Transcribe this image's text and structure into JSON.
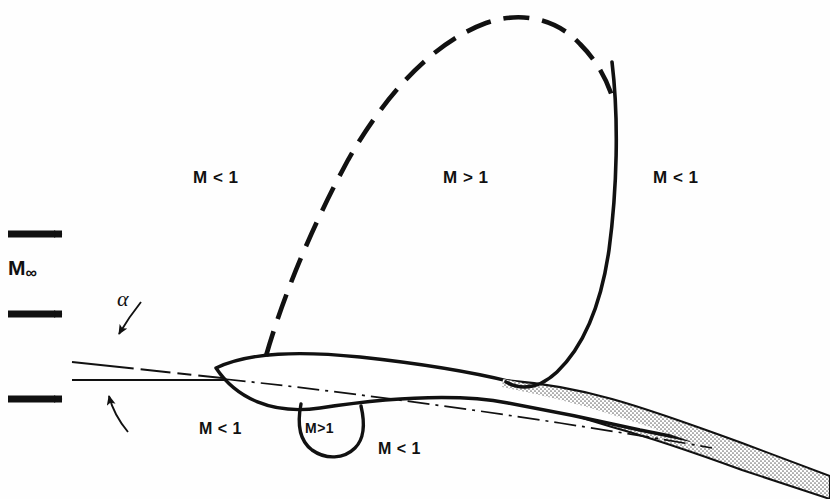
{
  "figure": {
    "background_color": "#fefefe",
    "line_color": "#111111",
    "wake_fill_color": "#b8b8b8"
  },
  "freestream": {
    "label": "M",
    "subscript": "∞",
    "arrow_count": 3,
    "arrow_name": "freestream-arrow"
  },
  "angle_of_attack": {
    "symbol": "α"
  },
  "regions": [
    {
      "id": "upper-left-subsonic",
      "label": "M < 1",
      "x": 193,
      "y": 168,
      "size": "lbl-big"
    },
    {
      "id": "upper-supersonic",
      "label": "M > 1",
      "x": 443,
      "y": 168,
      "size": "lbl-big"
    },
    {
      "id": "upper-right-subsonic",
      "label": "M < 1",
      "x": 653,
      "y": 168,
      "size": "lbl-big"
    },
    {
      "id": "lower-left-subsonic",
      "label": "M < 1",
      "x": 199,
      "y": 420,
      "size": "lbl-mid"
    },
    {
      "id": "lower-supersonic-bubble",
      "label": "M>1",
      "x": 305,
      "y": 420,
      "size": "lbl-small"
    },
    {
      "id": "lower-right-subsonic",
      "label": "M < 1",
      "x": 378,
      "y": 440,
      "size": "lbl-mid"
    }
  ],
  "chart_data": {
    "type": "diagram",
    "annotations": [
      "M < 1 upstream and outside the supersonic pocket",
      "M > 1 inside the embedded supersonic pocket above the airfoil",
      "M < 1 downstream of the shock wave",
      "M < 1 ahead of the lower-surface bubble",
      "M > 1 in the small lower-surface supersonic bubble",
      "M < 1 aft of the lower-surface bubble"
    ],
    "elements": [
      {
        "name": "freestream-arrows",
        "count": 3,
        "style": "solid black arrows pointing right"
      },
      {
        "name": "sonic-line",
        "style": "dashed"
      },
      {
        "name": "shock-wave",
        "style": "solid"
      },
      {
        "name": "lower-sonic-bubble",
        "style": "solid U-shaped arc"
      },
      {
        "name": "airfoil",
        "style": "solid outline, tilted nose-up"
      },
      {
        "name": "chord-line",
        "style": "dash-dot"
      },
      {
        "name": "freestream-reference-line",
        "style": "solid thin horizontal"
      },
      {
        "name": "wake",
        "style": "stippled gray band"
      }
    ]
  }
}
